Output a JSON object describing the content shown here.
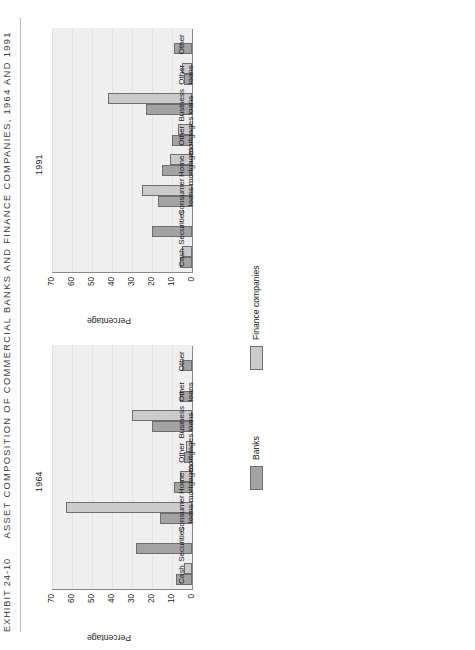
{
  "exhibit": {
    "number": "EXHIBIT 24-10",
    "title": "ASSET COMPOSITION OF COMMERCIAL BANKS AND FINANCE COMPANIES, 1964 AND 1991"
  },
  "legend": {
    "items": [
      {
        "label": "Banks",
        "color": "#a3a3a3",
        "key": "banks"
      },
      {
        "label": "Finance companies",
        "color": "#cbcbcb",
        "key": "finance"
      }
    ]
  },
  "axis": {
    "ylabel": "Percentage",
    "ticks": [
      "0",
      "10",
      "20",
      "30",
      "40",
      "50",
      "60",
      "70"
    ]
  },
  "chart_data": [
    {
      "type": "bar",
      "title": "1964",
      "xlabel": "",
      "ylabel": "Percentage",
      "ylim": [
        0,
        70
      ],
      "grid": true,
      "legend_position": "bottom-center",
      "categories": [
        "Cash",
        "Securities",
        "Consumer\nloans",
        "Home\nmortgages",
        "Other\nmortgages",
        "Business\nloans",
        "Other\nloans",
        "Other"
      ],
      "series": [
        {
          "name": "Banks",
          "color": "#a3a3a3",
          "values": [
            8,
            28,
            16,
            9,
            4,
            20,
            6,
            5
          ]
        },
        {
          "name": "Finance companies",
          "color": "#cbcbcb",
          "values": [
            4,
            0,
            63,
            6,
            3,
            30,
            0,
            0
          ]
        }
      ]
    },
    {
      "type": "bar",
      "title": "1991",
      "xlabel": "",
      "ylabel": "Percentage",
      "ylim": [
        0,
        70
      ],
      "grid": true,
      "legend_position": "bottom-center",
      "categories": [
        "Cash",
        "Securities",
        "Consumer\nloans",
        "Home\nmortgages",
        "Other\nmortgages",
        "Business\nloans",
        "Other\nloans",
        "Other"
      ],
      "series": [
        {
          "name": "Banks",
          "color": "#a3a3a3",
          "values": [
            6,
            20,
            17,
            15,
            10,
            23,
            4,
            9
          ]
        },
        {
          "name": "Finance companies",
          "color": "#cbcbcb",
          "values": [
            5,
            0,
            25,
            11,
            7,
            42,
            5,
            0
          ]
        }
      ]
    }
  ]
}
